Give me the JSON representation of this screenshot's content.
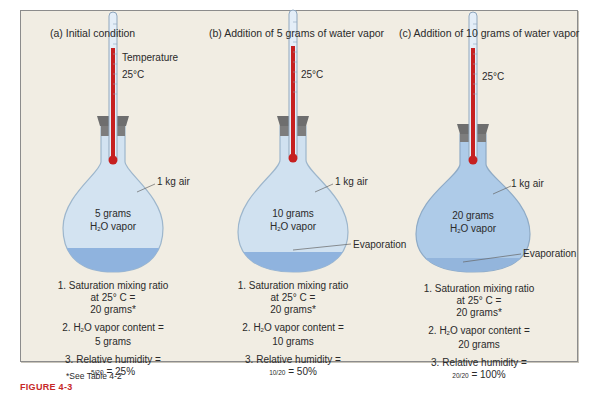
{
  "figure": {
    "caption_partial": "FIGURE 4-3",
    "footnote": "*See Table 4-2"
  },
  "colors": {
    "panel_bg": "#f1ede3",
    "flask_fill": "#cfe0ef",
    "flask_fill_c": "#a9c9e8",
    "water": "#8fb3de",
    "mercury": "#c62020",
    "stopper": "#6e6e6e",
    "caption": "#c62828"
  },
  "panels": [
    {
      "title": "(a) Initial condition",
      "thermometer_label": "Temperature",
      "temperature": "25°C",
      "air_label": "1 kg air",
      "vapor_amount": "5 grams",
      "vapor_label_pre": "H",
      "vapor_label_sub": "2",
      "vapor_label_post": "O vapor",
      "evaporation_label": "",
      "notes": {
        "line1a": "1. Saturation mixing ratio",
        "line1b": "at 25° C =",
        "line1c": "20 grams*",
        "line2a_pre": "2. H",
        "line2a_sub": "2",
        "line2a_post": "O vapor content =",
        "line2b": "5 grams",
        "line3a": "3. Relative humidity =",
        "line3b_frac": "5/20",
        "line3b_val": "= 25%"
      },
      "relative_humidity_pct": 25
    },
    {
      "title": "(b) Addition of 5 grams of water vapor",
      "temperature": "25°C",
      "air_label": "1 kg air",
      "vapor_amount": "10 grams",
      "vapor_label_pre": "H",
      "vapor_label_sub": "2",
      "vapor_label_post": "O vapor",
      "evaporation_label": "Evaporation",
      "notes": {
        "line1a": "1. Saturation mixing ratio",
        "line1b": "at 25° C =",
        "line1c": "20 grams*",
        "line2a_pre": "2. H",
        "line2a_sub": "2",
        "line2a_post": "O vapor content =",
        "line2b": "10 grams",
        "line3a": "3. Relative humidity =",
        "line3b_frac": "10/20",
        "line3b_val": "= 50%"
      },
      "relative_humidity_pct": 50
    },
    {
      "title": "(c) Addition of 10 grams of  water vapor",
      "temperature": "25°C",
      "air_label": "1 kg air",
      "vapor_amount": "20 grams",
      "vapor_label_pre": "H",
      "vapor_label_sub": "2",
      "vapor_label_post": "O vapor",
      "evaporation_label": "Evaporation",
      "notes": {
        "line1a": "1. Saturation mixing ratio",
        "line1b": "at 25° C =",
        "line1c": "20 grams*",
        "line2a_pre": "2. H",
        "line2a_sub": "2",
        "line2a_post": "O vapor content =",
        "line2b": "20 grams",
        "line3a": "3. Relative humidity =",
        "line3b_frac": "20/20",
        "line3b_val": "= 100%"
      },
      "relative_humidity_pct": 100
    }
  ]
}
